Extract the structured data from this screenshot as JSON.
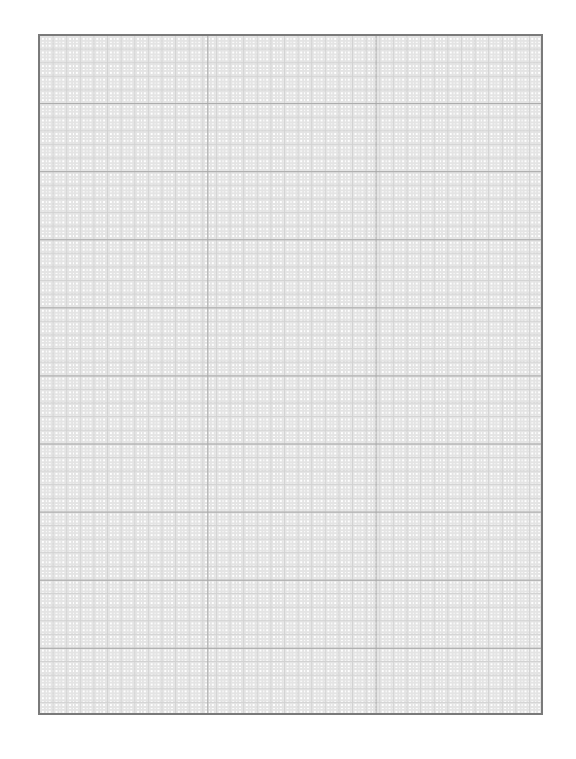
{
  "document": {
    "type": "graph-paper",
    "grid": {
      "major_columns": 3,
      "major_rows": 10,
      "minor_per_major": 5,
      "fine_dashed_subdivisions": true,
      "colors": {
        "border": "#7a7a7a",
        "major_line": "#a8a8a8",
        "minor_line": "#d2d2d2",
        "dashed_line": "#e4e4e4",
        "background": "#ffffff"
      }
    }
  }
}
